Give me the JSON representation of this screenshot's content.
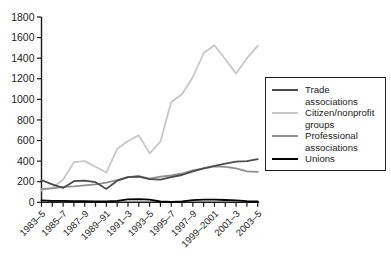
{
  "chart_data": {
    "type": "line",
    "title": "",
    "xlabel": "",
    "ylabel": "",
    "ylim": [
      0,
      1800
    ],
    "y_ticks": [
      0,
      200,
      400,
      600,
      800,
      1000,
      1200,
      1400,
      1600,
      1800
    ],
    "grid": false,
    "legend_position": "right",
    "x_tick_labels": [
      "1983–5",
      "1985–7",
      "1987–9",
      "1989–91",
      "1991–3",
      "1993–5",
      "1995–7",
      "1997–9",
      "1999–2001",
      "2001–3",
      "2003–5"
    ],
    "x_periods": [
      "1983–5",
      "1984–6",
      "1985–7",
      "1986–8",
      "1987–9",
      "1988–90",
      "1989–91",
      "1990–2",
      "1991–3",
      "1992–4",
      "1993–5",
      "1994–6",
      "1995–7",
      "1996–8",
      "1997–9",
      "1998–2000",
      "1999–2001",
      "2000–2",
      "2001–3",
      "2002–4",
      "2003–5"
    ],
    "series": [
      {
        "name": "Trade associations",
        "color": "#4b4b4b",
        "values": [
          215,
          175,
          140,
          205,
          210,
          195,
          130,
          210,
          245,
          250,
          225,
          220,
          245,
          265,
          300,
          330,
          355,
          375,
          395,
          400,
          420
        ]
      },
      {
        "name": "Citizen/nonprofit groups",
        "color": "#c7c7c7",
        "values": [
          115,
          145,
          220,
          390,
          400,
          345,
          290,
          520,
          595,
          650,
          475,
          590,
          975,
          1050,
          1215,
          1450,
          1525,
          1390,
          1250,
          1400,
          1520
        ]
      },
      {
        "name": "Professional associations",
        "color": "#8f8f8f",
        "values": [
          130,
          135,
          150,
          155,
          165,
          175,
          190,
          215,
          245,
          255,
          230,
          250,
          260,
          280,
          310,
          330,
          350,
          345,
          330,
          300,
          295
        ]
      },
      {
        "name": "Unions",
        "color": "#000000",
        "values": [
          18,
          15,
          15,
          12,
          12,
          10,
          8,
          15,
          28,
          30,
          25,
          8,
          5,
          10,
          20,
          25,
          25,
          22,
          18,
          12,
          8
        ]
      }
    ],
    "axis_color": "#1a1a1a",
    "tick_label_color": "#222222"
  },
  "legend": {
    "items": [
      {
        "label": "Trade associations"
      },
      {
        "label": "Citizen/nonprofit groups"
      },
      {
        "label": "Professional associations"
      },
      {
        "label": "Unions"
      }
    ]
  }
}
